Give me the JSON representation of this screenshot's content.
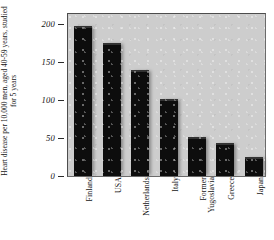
{
  "chart_data": {
    "type": "bar",
    "title": "",
    "subtitle": "",
    "xlabel": "",
    "ylabel": "Heart disease per 10,000 men, aged 40-59 years, studied for 5 years",
    "categories": [
      "Finland",
      "USA",
      "Netherlands",
      "Italy",
      "Former\nYugoslavia",
      "Greece",
      "Japan"
    ],
    "values": [
      198,
      175,
      140,
      101,
      51,
      43,
      25
    ],
    "ylim": [
      0,
      210
    ],
    "yticks": [
      0,
      50,
      100,
      150,
      200
    ],
    "ytick_labels": [
      "0",
      "50",
      "100",
      "150",
      "200"
    ],
    "grid": false,
    "legend": false,
    "legend_position": "none",
    "bar_color": "#0d0d0d",
    "plot_background": "#cdcdcd",
    "page_background": "#ffffff"
  }
}
